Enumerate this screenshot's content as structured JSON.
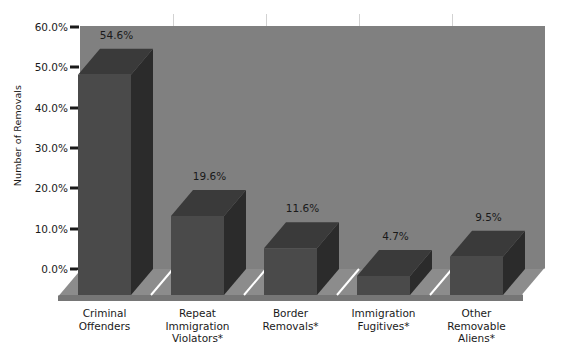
{
  "chart_data": {
    "type": "bar",
    "title": "",
    "xlabel": "",
    "ylabel": "Number of Removals",
    "categories": [
      "Criminal\nOffenders",
      "Repeat\nImmigration\nViolators*",
      "Border\nRemovals*",
      "Immigration\nFugitives*",
      "Other\nRemovable\nAliens*"
    ],
    "values": [
      54.6,
      19.6,
      11.6,
      4.7,
      9.5
    ],
    "value_labels": [
      "54.6%",
      "19.6%",
      "11.6%",
      "4.7%",
      "9.5%"
    ],
    "ylim": [
      0,
      60
    ],
    "ytick_labels": [
      "0.0%",
      "10.0%",
      "20.0%",
      "30.0%",
      "40.0%",
      "50.0%",
      "60.0%"
    ],
    "ytick_values": [
      0,
      10,
      20,
      30,
      40,
      50,
      60
    ],
    "grid": false,
    "legend": null,
    "style": "3d-column",
    "colors": {
      "background": "#ffffff",
      "back_wall": "#808080",
      "floor": "#8c8c8c",
      "floor_edge": "#767676",
      "bar_front": "#4a4a4a",
      "bar_side": "#2b2b2b",
      "bar_top": "#3a3a3a",
      "separator": "#d2d2d2",
      "divider_line": "#ffffff",
      "text": "#1a1a1a"
    }
  }
}
